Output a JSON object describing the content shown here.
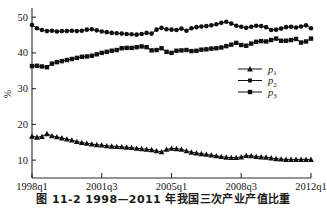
{
  "figure": {
    "caption": "图 11-2  1998—2011 年我国三次产业产值比重",
    "ylabel": "%",
    "xlabel": ""
  },
  "axes": {
    "y_ticks": [
      "10",
      "20",
      "30",
      "40",
      "50"
    ],
    "y_tick_values": [
      10,
      20,
      30,
      40,
      50
    ],
    "y_min": 5,
    "y_max": 52,
    "x_ticks": [
      "1998q1",
      "2001q3",
      "2005q1",
      "2008q3",
      "2012q1"
    ],
    "x_tick_indices": [
      0,
      14,
      28,
      42,
      56
    ],
    "x_min": 0,
    "x_max": 56
  },
  "legend": {
    "position": "center-right",
    "entries": [
      {
        "base": "p",
        "sub": "1",
        "marker": "triangle"
      },
      {
        "base": "p",
        "sub": "2",
        "marker": "circle"
      },
      {
        "base": "p",
        "sub": "3",
        "marker": "square"
      }
    ]
  },
  "colors": {
    "ink": "#101010",
    "axis": "#2b2b2b",
    "background": "#ffffff"
  },
  "chart_data": {
    "type": "line",
    "title": "图 11-2  1998—2011 年我国三次产业产值比重",
    "xlabel": "",
    "ylabel": "%",
    "ylim": [
      5,
      52
    ],
    "grid": false,
    "legend_position": "center-right",
    "x_tick_labels": [
      "1998q1",
      "2001q3",
      "2005q1",
      "2008q3",
      "2012q1"
    ],
    "x_tick_indices": [
      0,
      14,
      28,
      42,
      56
    ],
    "x": [
      "1998q1",
      "1998q2",
      "1998q3",
      "1998q4",
      "1999q1",
      "1999q2",
      "1999q3",
      "1999q4",
      "2000q1",
      "2000q2",
      "2000q3",
      "2000q4",
      "2001q1",
      "2001q2",
      "2001q3",
      "2001q4",
      "2002q1",
      "2002q2",
      "2002q3",
      "2002q4",
      "2003q1",
      "2003q2",
      "2003q3",
      "2003q4",
      "2004q1",
      "2004q2",
      "2004q3",
      "2004q4",
      "2005q1",
      "2005q2",
      "2005q3",
      "2005q4",
      "2006q1",
      "2006q2",
      "2006q3",
      "2006q4",
      "2007q1",
      "2007q2",
      "2007q3",
      "2007q4",
      "2008q1",
      "2008q2",
      "2008q3",
      "2008q4",
      "2009q1",
      "2009q2",
      "2009q3",
      "2009q4",
      "2010q1",
      "2010q2",
      "2010q3",
      "2010q4",
      "2011q1",
      "2011q2",
      "2011q3",
      "2011q4",
      "2012q1"
    ],
    "series": [
      {
        "name": "p1",
        "label": "p₁",
        "marker": "triangle",
        "values": [
          16.7,
          16.4,
          16.6,
          17.4,
          16.8,
          16.5,
          16.2,
          15.9,
          15.6,
          15.2,
          14.9,
          14.7,
          14.5,
          14.3,
          14.2,
          14.0,
          13.9,
          13.8,
          13.7,
          13.6,
          13.5,
          13.3,
          13.2,
          13.0,
          12.9,
          12.6,
          12.3,
          13.0,
          13.3,
          13.2,
          13.0,
          12.6,
          12.2,
          12.0,
          11.8,
          11.6,
          11.4,
          11.2,
          11.0,
          10.8,
          10.7,
          10.7,
          10.9,
          11.3,
          11.2,
          11.0,
          10.9,
          10.8,
          10.6,
          10.4,
          10.3,
          10.2,
          10.2,
          10.2,
          10.2,
          10.2,
          10.2
        ]
      },
      {
        "name": "p2",
        "label": "p₂",
        "marker": "circle",
        "values": [
          47.8,
          46.9,
          46.4,
          46.1,
          46.2,
          46.0,
          46.1,
          46.1,
          46.2,
          46.1,
          46.2,
          46.5,
          46.6,
          46.3,
          46.0,
          45.8,
          45.6,
          45.5,
          45.4,
          45.3,
          45.2,
          45.1,
          45.3,
          45.6,
          45.4,
          46.5,
          47.0,
          46.6,
          46.5,
          46.4,
          46.8,
          46.2,
          46.9,
          47.2,
          47.4,
          47.5,
          47.7,
          48.0,
          48.4,
          48.7,
          48.2,
          47.6,
          47.3,
          47.0,
          47.3,
          47.6,
          47.5,
          47.2,
          46.4,
          46.5,
          46.8,
          47.2,
          47.3,
          47.1,
          47.4,
          47.7,
          46.9
        ]
      },
      {
        "name": "p3",
        "label": "p₃",
        "marker": "square",
        "values": [
          36.3,
          36.4,
          36.2,
          36.0,
          37.0,
          37.4,
          37.7,
          38.0,
          38.3,
          38.6,
          38.9,
          39.0,
          39.2,
          39.6,
          40.0,
          40.3,
          40.6,
          40.8,
          41.3,
          41.4,
          41.4,
          41.6,
          41.8,
          41.6,
          40.7,
          40.8,
          41.3,
          40.3,
          40.0,
          40.6,
          40.7,
          40.8,
          40.5,
          40.6,
          40.9,
          41.0,
          41.2,
          41.3,
          41.5,
          41.9,
          42.3,
          42.8,
          42.2,
          42.0,
          42.6,
          43.1,
          43.3,
          43.2,
          43.6,
          44.0,
          43.4,
          43.4,
          43.6,
          43.9,
          42.9,
          43.2,
          44.0
        ]
      }
    ]
  }
}
